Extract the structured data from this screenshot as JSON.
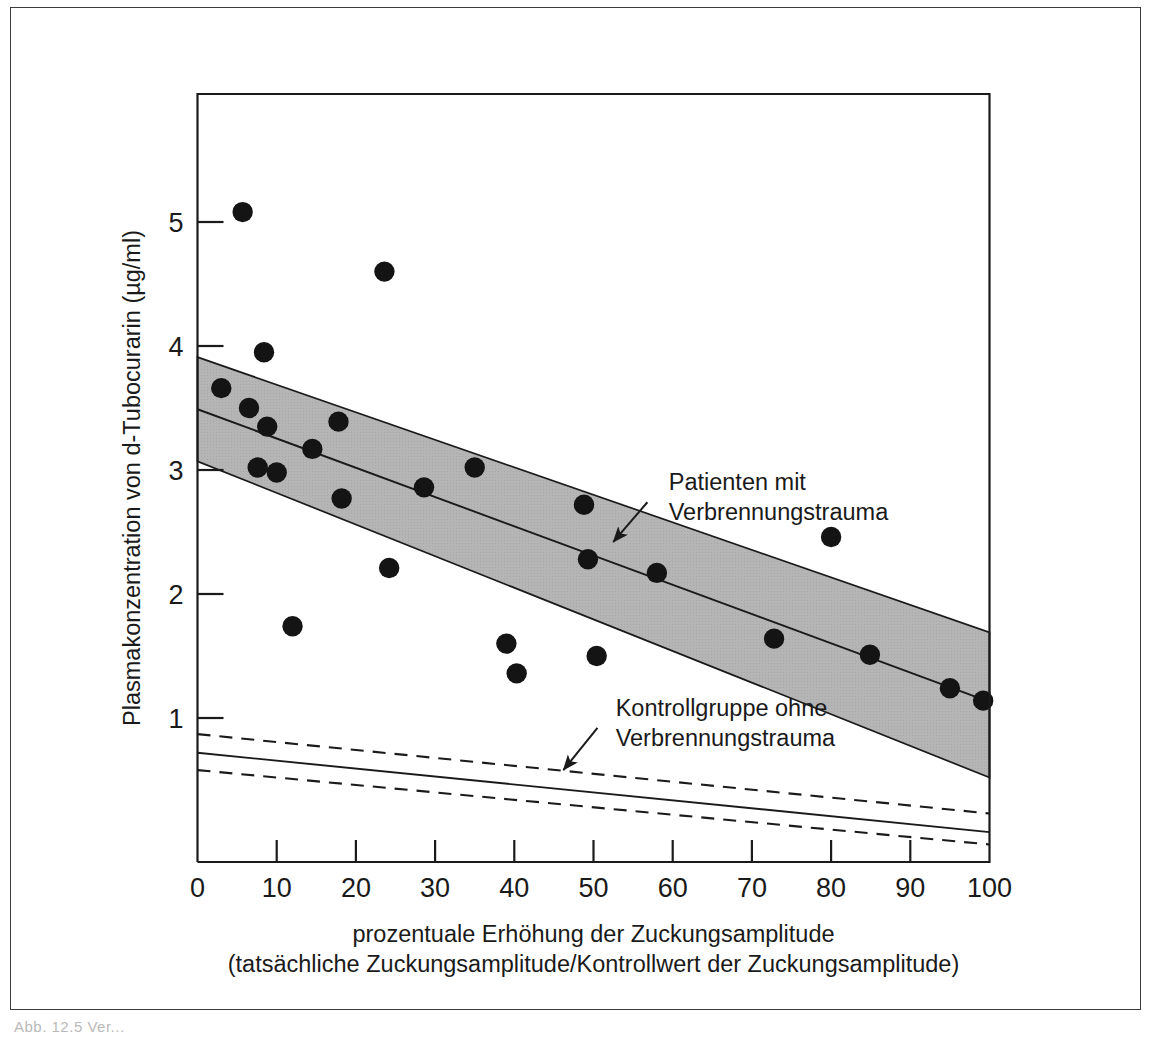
{
  "figure": {
    "caption_fragment": "Abb. 12.5  Ver...",
    "background_color": "#ffffff",
    "frame_color": "#3c3c3c"
  },
  "chart_data": {
    "type": "scatter",
    "title": "",
    "xlabel_line1": "prozentuale Erhöhung der Zuckungsamplitude",
    "xlabel_line2": "(tatsächliche Zuckungsamplitude/Kontrollwert der Zuckungsamplitude)",
    "ylabel": "Plasmakonzentration von d-Tubocurarin (µg/ml)",
    "xlim": [
      0,
      100
    ],
    "ylim": [
      -0.1,
      6.1
    ],
    "xticks": [
      0,
      10,
      20,
      30,
      40,
      50,
      60,
      70,
      80,
      90,
      100
    ],
    "xticklabels": [
      "0",
      "10",
      "20",
      "30",
      "40",
      "50",
      "60",
      "70",
      "80",
      "90",
      "100"
    ],
    "yticks": [
      1,
      2,
      3,
      4,
      5
    ],
    "yticklabels": [
      "1",
      "2",
      "3",
      "4",
      "5"
    ],
    "grid": false,
    "legend_position": "inline-annotations",
    "point_color": "#141414",
    "band_fill_color": "#b5b5b5",
    "line_color": "#1a1a1a",
    "series": [
      {
        "name": "Patienten mit Verbrennungstrauma",
        "type": "scatter",
        "points": [
          {
            "x": 3.0,
            "y": 3.66
          },
          {
            "x": 5.7,
            "y": 5.08
          },
          {
            "x": 6.5,
            "y": 3.5
          },
          {
            "x": 7.6,
            "y": 3.02
          },
          {
            "x": 8.4,
            "y": 3.95
          },
          {
            "x": 8.8,
            "y": 3.35
          },
          {
            "x": 10.0,
            "y": 2.98
          },
          {
            "x": 12.0,
            "y": 1.74
          },
          {
            "x": 14.5,
            "y": 3.17
          },
          {
            "x": 17.8,
            "y": 3.39
          },
          {
            "x": 18.2,
            "y": 2.77
          },
          {
            "x": 23.6,
            "y": 4.6
          },
          {
            "x": 24.2,
            "y": 2.21
          },
          {
            "x": 28.6,
            "y": 2.86
          },
          {
            "x": 35.0,
            "y": 3.02
          },
          {
            "x": 39.0,
            "y": 1.6
          },
          {
            "x": 40.3,
            "y": 1.36
          },
          {
            "x": 48.8,
            "y": 2.72
          },
          {
            "x": 49.3,
            "y": 2.28
          },
          {
            "x": 50.4,
            "y": 1.5
          },
          {
            "x": 58.0,
            "y": 2.17
          },
          {
            "x": 72.8,
            "y": 1.64
          },
          {
            "x": 80.0,
            "y": 2.46
          },
          {
            "x": 84.9,
            "y": 1.51
          },
          {
            "x": 95.0,
            "y": 1.24
          },
          {
            "x": 99.2,
            "y": 1.14
          }
        ],
        "regression_line": {
          "x": [
            0,
            100
          ],
          "y": [
            3.49,
            1.13
          ]
        },
        "confidence_band": {
          "x": [
            0,
            100
          ],
          "upper": [
            3.91,
            1.69
          ],
          "lower": [
            3.07,
            0.52
          ]
        }
      },
      {
        "name": "Kontrollgruppe ohne Verbrennungstrauma",
        "type": "line",
        "regression_line": {
          "x": [
            0,
            100
          ],
          "y": [
            0.72,
            0.08
          ]
        },
        "confidence_band": {
          "x": [
            0,
            100
          ],
          "upper": [
            0.87,
            0.23
          ],
          "lower": [
            0.58,
            -0.02
          ]
        },
        "band_style": "dashed"
      }
    ],
    "annotations": [
      {
        "id": "patients-annotation",
        "line1": "Patienten mit",
        "line2": "Verbrennungstrauma",
        "text_x": 59.5,
        "text_y": 2.84,
        "arrow_from": {
          "x": 56.8,
          "y": 2.74
        },
        "arrow_to": {
          "x": 52.5,
          "y": 2.42
        }
      },
      {
        "id": "control-annotation",
        "line1": "Kontrollgruppe ohne",
        "line2": "Verbrennungstrauma",
        "text_x": 52.8,
        "text_y": 1.02,
        "arrow_from": {
          "x": 50.5,
          "y": 0.92
        },
        "arrow_to": {
          "x": 46.2,
          "y": 0.58
        }
      }
    ]
  }
}
